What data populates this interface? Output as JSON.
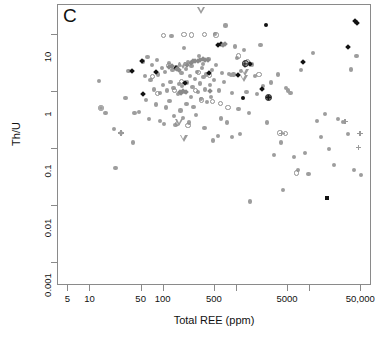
{
  "figure": {
    "panel_label": "C"
  },
  "chart_data": {
    "type": "scatter",
    "title": "C",
    "xlabel": "Total REE (ppm)",
    "ylabel": "Th/U",
    "xscale": "log",
    "yscale": "log",
    "xlim": [
      3.6,
      70000
    ],
    "ylim": [
      0.0004,
      33
    ],
    "grid": false,
    "legend": "none",
    "xticks": [
      {
        "value": 5,
        "label": "5"
      },
      {
        "value": 10,
        "label": "10"
      },
      {
        "value": 50,
        "label": "50"
      },
      {
        "value": 100,
        "label": "100"
      },
      {
        "value": 500,
        "label": "500"
      },
      {
        "value": 1000,
        "label": ""
      },
      {
        "value": 5000,
        "label": "5000"
      },
      {
        "value": 10000,
        "label": ""
      },
      {
        "value": 50000,
        "label": "50,000"
      }
    ],
    "yticks": [
      {
        "value": 10,
        "label": "10"
      },
      {
        "value": 1,
        "label": "1"
      },
      {
        "value": 0.1,
        "label": "0.1"
      },
      {
        "value": 0.01,
        "label": "0.01"
      },
      {
        "value": 0.001,
        "label": "0.001"
      }
    ],
    "series": [
      {
        "name": "gray-filled-circle",
        "marker": "gray-circle",
        "color": "#9d9d9d",
        "points": [
          [
            13,
            1.55
          ],
          [
            14,
            0.52
          ],
          [
            16,
            0.42
          ],
          [
            22,
            0.047
          ],
          [
            26,
            0.19
          ],
          [
            21,
            0.22
          ],
          [
            30,
            0.77
          ],
          [
            33,
            2.3
          ],
          [
            38,
            0.13
          ],
          [
            40,
            0.42
          ],
          [
            46,
            0.44
          ],
          [
            52,
            3.4
          ],
          [
            55,
            1.9
          ],
          [
            57,
            0.72
          ],
          [
            60,
            4.1
          ],
          [
            63,
            0.33
          ],
          [
            66,
            1.6
          ],
          [
            70,
            2.9
          ],
          [
            74,
            1.1
          ],
          [
            78,
            0.6
          ],
          [
            80,
            3.6
          ],
          [
            84,
            2.0
          ],
          [
            88,
            0.31
          ],
          [
            90,
            0.96
          ],
          [
            95,
            2.6
          ],
          [
            98,
            1.3
          ],
          [
            100,
            0.27
          ],
          [
            104,
            2.2
          ],
          [
            108,
            0.53
          ],
          [
            112,
            1.05
          ],
          [
            118,
            3.2
          ],
          [
            120,
            0.68
          ],
          [
            124,
            1.5
          ],
          [
            128,
            9.4
          ],
          [
            132,
            2.4
          ],
          [
            136,
            1.15
          ],
          [
            140,
            0.38
          ],
          [
            145,
            0.26
          ],
          [
            150,
            2.7
          ],
          [
            155,
            0.9
          ],
          [
            160,
            1.35
          ],
          [
            165,
            3.0
          ],
          [
            170,
            0.47
          ],
          [
            175,
            2.1
          ],
          [
            180,
            1.25
          ],
          [
            185,
            0.35
          ],
          [
            190,
            5.8
          ],
          [
            196,
            1.0
          ],
          [
            200,
            2.5
          ],
          [
            205,
            0.62
          ],
          [
            210,
            1.45
          ],
          [
            216,
            3.3
          ],
          [
            222,
            0.29
          ],
          [
            228,
            1.9
          ],
          [
            234,
            0.8
          ],
          [
            240,
            2.8
          ],
          [
            248,
            1.2
          ],
          [
            255,
            0.55
          ],
          [
            262,
            3.5
          ],
          [
            270,
            1.7
          ],
          [
            278,
            0.39
          ],
          [
            285,
            2.2
          ],
          [
            292,
            1.0
          ],
          [
            300,
            4.2
          ],
          [
            310,
            1.4
          ],
          [
            320,
            0.75
          ],
          [
            330,
            2.6
          ],
          [
            340,
            3.1
          ],
          [
            350,
            1.8
          ],
          [
            360,
            0.23
          ],
          [
            370,
            1.1
          ],
          [
            380,
            2.0
          ],
          [
            395,
            0.66
          ],
          [
            410,
            3.8
          ],
          [
            425,
            1.3
          ],
          [
            440,
            0.8
          ],
          [
            455,
            2.4
          ],
          [
            470,
            0.14
          ],
          [
            485,
            1.6
          ],
          [
            500,
            10.2
          ],
          [
            520,
            2.9
          ],
          [
            545,
            0.17
          ],
          [
            570,
            1.05
          ],
          [
            600,
            0.34
          ],
          [
            630,
            2.1
          ],
          [
            660,
            1.5
          ],
          [
            700,
            14.5
          ],
          [
            740,
            0.29
          ],
          [
            780,
            2.05
          ],
          [
            820,
            1.95
          ],
          [
            860,
            0.95
          ],
          [
            900,
            2.0
          ],
          [
            950,
            6.2
          ],
          [
            1000,
            3.9
          ],
          [
            1050,
            0.5
          ],
          [
            1100,
            0.18
          ],
          [
            1150,
            2.3
          ],
          [
            1250,
            5.3
          ],
          [
            1350,
            1.0
          ],
          [
            1450,
            0.42
          ],
          [
            1600,
            3.0
          ],
          [
            1750,
            1.9
          ],
          [
            1900,
            0.9
          ],
          [
            2100,
            6.5
          ],
          [
            2300,
            1.25
          ],
          [
            2600,
            0.29
          ],
          [
            2900,
            1.45
          ],
          [
            3200,
            0.078
          ],
          [
            3600,
            2.0
          ],
          [
            4000,
            0.13
          ],
          [
            4300,
            0.019
          ],
          [
            4700,
            1.15
          ],
          [
            5000,
            1.05
          ],
          [
            5400,
            0.95
          ],
          [
            6000,
            0.072
          ],
          [
            6800,
            0.043
          ],
          [
            7600,
            2.4
          ],
          [
            8600,
            0.085
          ],
          [
            9500,
            0.037
          ],
          [
            11000,
            4.8
          ],
          [
            12500,
            0.31
          ],
          [
            14000,
            0.16
          ],
          [
            16000,
            0.41
          ],
          [
            18000,
            0.1
          ],
          [
            21000,
            0.053
          ],
          [
            24000,
            0.33
          ],
          [
            28000,
            0.3
          ],
          [
            33000,
            0.18
          ],
          [
            40000,
            0.043
          ],
          [
            50000,
            0.035
          ],
          [
            43000,
            4.2
          ],
          [
            36000,
            2.45
          ],
          [
            1500,
            0.012
          ],
          [
            850,
            0.16
          ]
        ]
      },
      {
        "name": "open-circle",
        "marker": "open-circle",
        "color": "#8f8f8f",
        "points": [
          [
            14,
            0.52
          ],
          [
            70,
            1.85
          ],
          [
            82,
            0.93
          ],
          [
            100,
            9.6
          ],
          [
            118,
            2.9
          ],
          [
            140,
            1.05
          ],
          [
            155,
            0.28
          ],
          [
            175,
            1.5
          ],
          [
            190,
            10.0
          ],
          [
            215,
            0.26
          ],
          [
            240,
            9.9
          ],
          [
            270,
            1.05
          ],
          [
            300,
            2.2
          ],
          [
            330,
            0.72
          ],
          [
            360,
            10.1
          ],
          [
            420,
            1.95
          ],
          [
            460,
            0.68
          ],
          [
            520,
            9.8
          ],
          [
            600,
            0.62
          ],
          [
            760,
            0.53
          ],
          [
            1050,
            4.2
          ],
          [
            1400,
            3.3
          ],
          [
            2000,
            2.0
          ],
          [
            3900,
            0.19
          ],
          [
            6500,
            0.038
          ],
          [
            4600,
            0.185
          ]
        ]
      },
      {
        "name": "black-diamond",
        "marker": "black-diamond",
        "color": "#121212",
        "points": [
          [
            37,
            2.35
          ],
          [
            50,
            3.5
          ],
          [
            52,
            0.92
          ],
          [
            78,
            2.25
          ],
          [
            145,
            2.6
          ],
          [
            195,
            1.45
          ],
          [
            420,
            2.15
          ],
          [
            560,
            6.7
          ],
          [
            600,
            6.9
          ],
          [
            1050,
            2.0
          ],
          [
            1300,
            2.95
          ],
          [
            1500,
            3.05
          ],
          [
            2200,
            1.1
          ],
          [
            8000,
            3.3
          ],
          [
            33000,
            6.2
          ],
          [
            41000,
            17.5
          ],
          [
            43000,
            16.0
          ]
        ]
      },
      {
        "name": "gray-diamond",
        "marker": "gray-diamond",
        "color": "#8a8a8a",
        "points": [
          [
            150,
            2.55
          ],
          [
            160,
            2.4
          ],
          [
            185,
            1.05
          ],
          [
            200,
            1.0
          ],
          [
            210,
            2.95
          ],
          [
            235,
            3.2
          ],
          [
            250,
            3.4
          ],
          [
            265,
            3.45
          ],
          [
            290,
            3.5
          ],
          [
            310,
            3.55
          ],
          [
            340,
            3.7
          ],
          [
            370,
            3.65
          ],
          [
            400,
            3.6
          ],
          [
            430,
            1.05
          ],
          [
            175,
            0.95
          ],
          [
            165,
            1.0
          ],
          [
            640,
            6.6
          ],
          [
            680,
            6.8
          ],
          [
            120,
            2.75
          ],
          [
            130,
            2.85
          ]
        ]
      },
      {
        "name": "open-triangle-down",
        "marker": "open-triangle-down",
        "color": "#9b9b9b",
        "points": [
          [
            330,
            26.0
          ],
          [
            185,
            2.85
          ],
          [
            165,
            0.29
          ],
          [
            190,
            0.155
          ],
          [
            1300,
            2.2
          ],
          [
            1250,
            1.7
          ]
        ]
      },
      {
        "name": "circled-plus",
        "marker": "circled-plus",
        "color": "#161616",
        "points": [
          [
            1300,
            3.1
          ],
          [
            2700,
            0.8
          ]
        ]
      },
      {
        "name": "black-square",
        "marker": "black-square",
        "color": "#121212",
        "points": [
          [
            17000,
            0.0138
          ]
        ]
      },
      {
        "name": "gray-plus",
        "marker": "gray-plus",
        "color": "#9a9a9a",
        "points": [
          [
            26,
            0.19
          ],
          [
            4100,
            0.185
          ],
          [
            30000,
            0.3
          ],
          [
            46000,
            0.107
          ],
          [
            48000,
            0.185
          ]
        ]
      },
      {
        "name": "black-circle",
        "marker": "black-circle",
        "color": "#121212",
        "points": [
          [
            2500,
            14.8
          ],
          [
            1200,
            0.78
          ]
        ]
      }
    ]
  }
}
